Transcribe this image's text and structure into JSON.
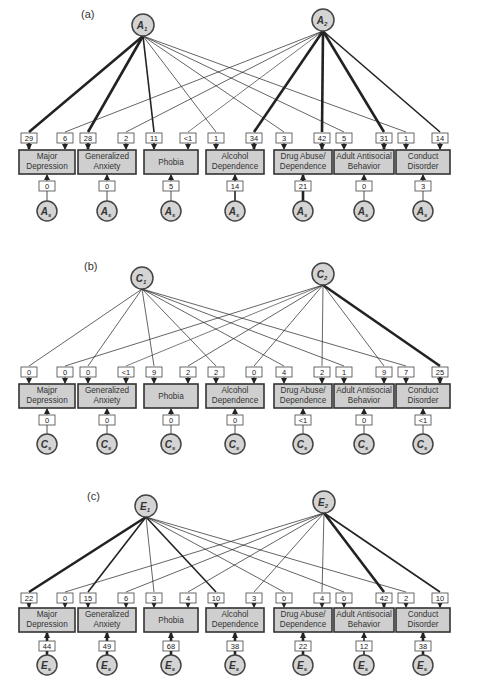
{
  "variables": [
    "Major Depression",
    "Generalized Anxiety",
    "Phobia",
    "Alcohol Dependence",
    "Drug Abuse/ Dependence",
    "Adult Antisocial Behavior",
    "Conduct Disorder"
  ],
  "variable_lines": [
    [
      "Major",
      "Depression"
    ],
    [
      "Generalized",
      "Anxiety"
    ],
    [
      "Phobia"
    ],
    [
      "Alcohol",
      "Dependence"
    ],
    [
      "Drug Abuse/",
      "Dependence"
    ],
    [
      "Adult Antisocial",
      "Behavior"
    ],
    [
      "Conduct",
      "Disorder"
    ]
  ],
  "panels": [
    {
      "label": "(a)",
      "factor1": {
        "letter": "A",
        "sub": "1"
      },
      "factor2": {
        "letter": "A",
        "sub": "2"
      },
      "specific": {
        "letter": "A",
        "sub": "s"
      },
      "loadings_f1": [
        "29",
        "28",
        "11",
        "1",
        "3",
        "5",
        "1"
      ],
      "loadings_f2": [
        "6",
        "2",
        "<1",
        "34",
        "42",
        "31",
        "14"
      ],
      "specific_values": [
        "0",
        "0",
        "5",
        "14",
        "21",
        "0",
        "3"
      ]
    },
    {
      "label": "(b)",
      "factor1": {
        "letter": "C",
        "sub": "1"
      },
      "factor2": {
        "letter": "C",
        "sub": "2"
      },
      "specific": {
        "letter": "C",
        "sub": "s"
      },
      "variable_override_0": [
        "Majpr",
        "Depression"
      ],
      "loadings_f1": [
        "0",
        "0",
        "9",
        "2",
        "4",
        "1",
        "7"
      ],
      "loadings_f2": [
        "0",
        "<1",
        "2",
        "0",
        "2",
        "9",
        "25"
      ],
      "specific_values": [
        "0",
        "0",
        "0",
        "0",
        "<1",
        "0",
        "<1"
      ]
    },
    {
      "label": "(c)",
      "factor1": {
        "letter": "E",
        "sub": "1"
      },
      "factor2": {
        "letter": "E",
        "sub": "2"
      },
      "specific": {
        "letter": "E",
        "sub": "s"
      },
      "loadings_f1": [
        "22",
        "15",
        "3",
        "10",
        "0",
        "0",
        "2"
      ],
      "loadings_f2": [
        "0",
        "6",
        "4",
        "3",
        "4",
        "42",
        "10"
      ],
      "specific_values": [
        "44",
        "49",
        "68",
        "38",
        "22",
        "12",
        "38"
      ]
    }
  ]
}
